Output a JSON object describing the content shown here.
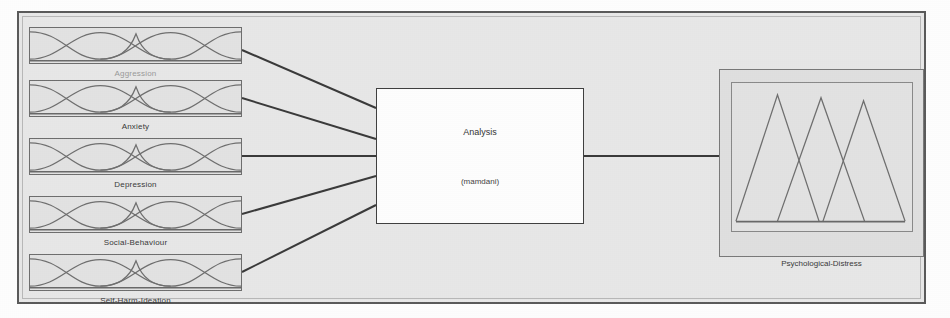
{
  "diagram": {
    "inference_method": "mamdani",
    "engine": {
      "title": "Analysis",
      "subtitle": "(mamdani)"
    },
    "inputs": [
      {
        "name": "Aggression",
        "mf_count": 3,
        "mf_type": "gaussian"
      },
      {
        "name": "Anxiety",
        "mf_count": 3,
        "mf_type": "gaussian"
      },
      {
        "name": "Depression",
        "mf_count": 3,
        "mf_type": "gaussian"
      },
      {
        "name": "Social-Behaviour",
        "mf_count": 3,
        "mf_type": "gaussian"
      },
      {
        "name": "Self-Harm-Ideation",
        "mf_count": 3,
        "mf_type": "gaussian"
      }
    ],
    "outputs": [
      {
        "name": "Psychological-Distress",
        "mf_count": 3,
        "mf_type": "triangular"
      }
    ],
    "colors": {
      "frame_border": "#5b5b5b",
      "canvas_background": "#e9e9e9",
      "box_background": "#e4e4e4",
      "engine_background": "#ffffff",
      "curve_stroke": "#707070",
      "link_stroke": "#3a3a3a",
      "text": "#3a3a3a"
    }
  }
}
